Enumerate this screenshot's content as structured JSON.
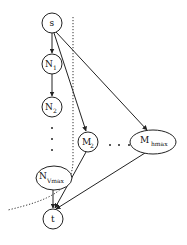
{
  "diagram": {
    "type": "directed-graph",
    "nodes": {
      "s": {
        "label": "s",
        "sub": ""
      },
      "n1": {
        "label": "N",
        "sub": "1"
      },
      "n2": {
        "label": "N",
        "sub": "2"
      },
      "nvmax": {
        "label": "N",
        "sub": "Vmax"
      },
      "m2": {
        "label": "M",
        "sub": "2"
      },
      "mhmax": {
        "label": "M",
        "sub": "hmax"
      },
      "t": {
        "label": "t",
        "sub": ""
      }
    },
    "edges": [
      {
        "from": "s",
        "to": "N1"
      },
      {
        "from": "N1",
        "to": "N2"
      },
      {
        "from": "s",
        "to": "M2"
      },
      {
        "from": "s",
        "to": "M hmax"
      },
      {
        "from": "N Vmax",
        "to": "t"
      },
      {
        "from": "M2",
        "to": "t"
      },
      {
        "from": "M hmax",
        "to": "t"
      }
    ],
    "ellipsis_vertical": "⋮",
    "ellipsis_horizontal": "· · ·",
    "cut_line": "dotted separator curve"
  }
}
